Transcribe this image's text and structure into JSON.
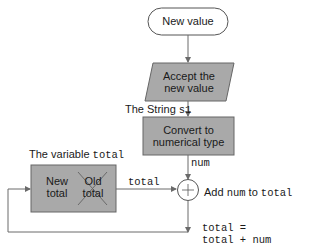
{
  "diagram": {
    "start": {
      "label": "New value"
    },
    "input": {
      "line1": "Accept the",
      "line2": "new value"
    },
    "string_label": {
      "prefix": "The String ",
      "var": "s1"
    },
    "convert": {
      "line1": "Convert to",
      "line2": "numerical type"
    },
    "num_label": "num",
    "variable_label": {
      "prefix": "The variable ",
      "var": "total"
    },
    "variable_box": {
      "new_line1": "New",
      "new_line2": "total",
      "old_line1": "Old",
      "old_line2": "total"
    },
    "arrow_total_label": "total",
    "add": {
      "symbol": "+",
      "prefix": "Add ",
      "var1": "num",
      "mid": " to ",
      "var2": "total"
    },
    "assignment": {
      "line1": "total =",
      "line2": "total + num"
    },
    "colors": {
      "box_fill": "#a9a9a9",
      "stroke": "#555555",
      "line": "#6a6a6a"
    }
  }
}
